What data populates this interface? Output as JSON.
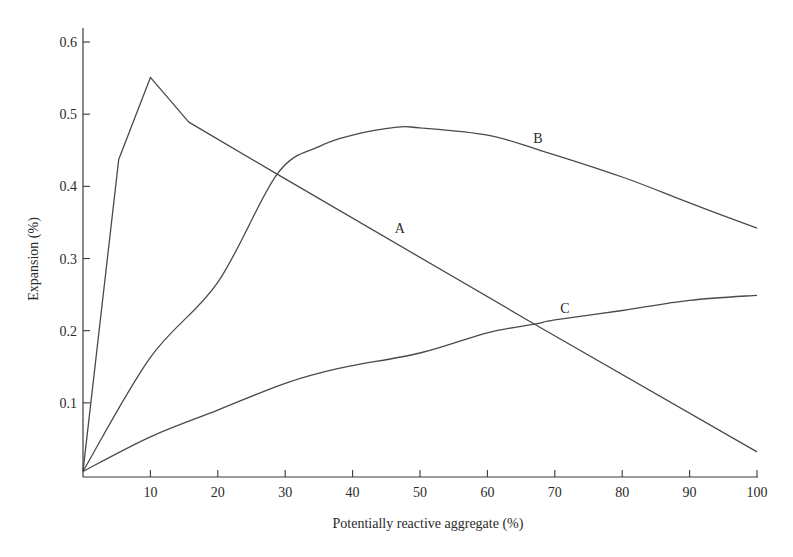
{
  "chart_data": {
    "type": "line",
    "title": "",
    "xlabel": "Potentially reactive aggregate (%)",
    "ylabel": "Expansion (%)",
    "xlim": [
      0,
      100
    ],
    "ylim": [
      0,
      0.6
    ],
    "grid": false,
    "legend": "none (inline curve labels)",
    "x_ticks": [
      10,
      20,
      30,
      40,
      50,
      60,
      70,
      80,
      90,
      100
    ],
    "x_tick_labels": [
      "10",
      "20",
      "30",
      "40",
      "50",
      "60",
      "70",
      "80",
      "90",
      "100"
    ],
    "y_ticks": [
      0.1,
      0.2,
      0.3,
      0.4,
      0.5,
      0.6
    ],
    "y_tick_labels": [
      "0.1",
      "0.2",
      "0.3",
      "0.4",
      "0.5",
      "0.6"
    ],
    "series": [
      {
        "name": "A",
        "label": "A",
        "label_at": [
          47,
          0.335
        ],
        "x": [
          0,
          5.3,
          10,
          15.7,
          28.8,
          67,
          100
        ],
        "y": [
          0.005,
          0.437,
          0.551,
          0.489,
          0.417,
          0.209,
          0.032
        ]
      },
      {
        "name": "B",
        "label": "B",
        "label_at": [
          67.5,
          0.46
        ],
        "smooth": true,
        "x": [
          0,
          10,
          20,
          28.8,
          35,
          40,
          46.6,
          50,
          60,
          67.8,
          80,
          90,
          100
        ],
        "y": [
          0.005,
          0.163,
          0.267,
          0.417,
          0.455,
          0.471,
          0.482,
          0.481,
          0.471,
          0.45,
          0.413,
          0.377,
          0.342
        ]
      },
      {
        "name": "C",
        "label": "C",
        "label_at": [
          71.5,
          0.225
        ],
        "smooth": true,
        "x": [
          0,
          10,
          20,
          30,
          38.1,
          50,
          60,
          67,
          70,
          80,
          90,
          100
        ],
        "y": [
          0.005,
          0.053,
          0.09,
          0.127,
          0.148,
          0.169,
          0.197,
          0.209,
          0.215,
          0.228,
          0.242,
          0.249
        ]
      }
    ]
  }
}
